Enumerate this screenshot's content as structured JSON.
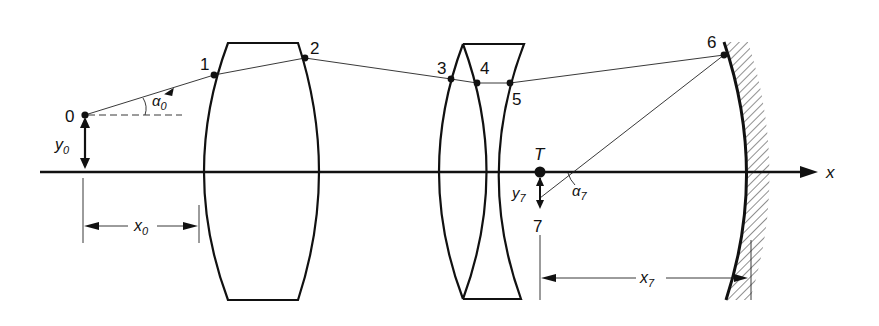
{
  "diagram": {
    "type": "optical ray trace through lens system and concave mirror",
    "axis_label": "x",
    "points": [
      {
        "id": "0",
        "label": "0"
      },
      {
        "id": "1",
        "label": "1"
      },
      {
        "id": "2",
        "label": "2"
      },
      {
        "id": "3",
        "label": "3"
      },
      {
        "id": "4",
        "label": "4"
      },
      {
        "id": "5",
        "label": "5"
      },
      {
        "id": "6",
        "label": "6"
      },
      {
        "id": "7",
        "label": "7"
      }
    ],
    "target_label": "T",
    "labels": {
      "alpha0": "α",
      "alpha0_sub": "0",
      "y0": "y",
      "y0_sub": "0",
      "x0": "x",
      "x0_sub": "0",
      "alpha7": "α",
      "alpha7_sub": "7",
      "y7": "y",
      "y7_sub": "7",
      "x7": "x",
      "x7_sub": "7"
    },
    "elements": [
      "biconvex lens (surfaces 1-2)",
      "biconvex lens (surfaces 3-4)",
      "biconcave lens (surfaces 4-5)",
      "concave mirror (surface 6)"
    ]
  }
}
